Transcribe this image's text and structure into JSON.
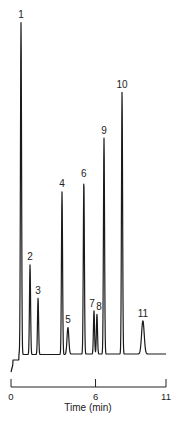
{
  "chart_data": {
    "type": "line",
    "title": "",
    "xlabel": "Time (min)",
    "ylabel": "",
    "xlim": [
      0,
      11
    ],
    "x_ticks": [
      0,
      6,
      11
    ],
    "x_tick_labels": [
      "0",
      "6",
      "11"
    ],
    "grid": false,
    "legend": null,
    "peaks": [
      {
        "label": "1",
        "time": 0.71,
        "relative_height": 1.0
      },
      {
        "label": "2",
        "time": 1.35,
        "relative_height": 0.27
      },
      {
        "label": "3",
        "time": 1.92,
        "relative_height": 0.17
      },
      {
        "label": "4",
        "time": 3.62,
        "relative_height": 0.49
      },
      {
        "label": "5",
        "time": 4.04,
        "relative_height": 0.08
      },
      {
        "label": "6",
        "time": 5.17,
        "relative_height": 0.52
      },
      {
        "label": "7",
        "time": 5.89,
        "relative_height": 0.13
      },
      {
        "label": "8",
        "time": 6.1,
        "relative_height": 0.12
      },
      {
        "label": "9",
        "time": 6.6,
        "relative_height": 0.65
      },
      {
        "label": "10",
        "time": 7.88,
        "relative_height": 0.79
      },
      {
        "label": "11",
        "time": 9.36,
        "relative_height": 0.1
      }
    ]
  }
}
